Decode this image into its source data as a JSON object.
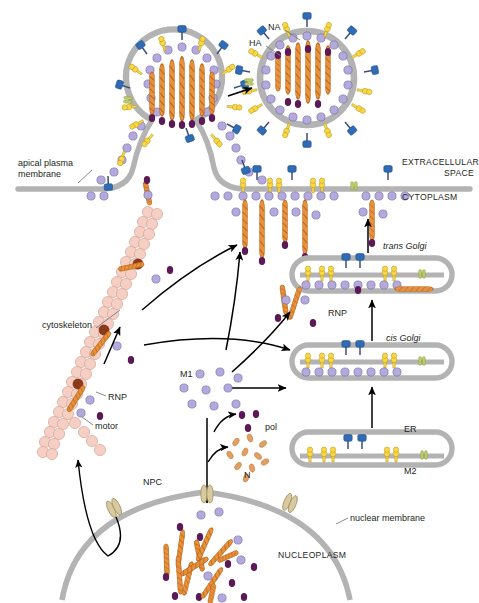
{
  "figure": {
    "domain": "biology-cell-diagram"
  },
  "labels": {
    "na": "NA",
    "ha": "HA",
    "apical_plasma_membrane_line1": "apical plasma",
    "apical_plasma_membrane_line2": "membrane",
    "extracellular_line1": "EXTRACELLULAR",
    "extracellular_line2": "SPACE",
    "cytoplasm": "CYTOPLASM",
    "trans_golgi": "trans Golgi",
    "cis_golgi": "cis Golgi",
    "er": "ER",
    "m2": "M2",
    "rnp_membrane": "RNP",
    "rnp_golgi": "RNP",
    "rnp_cytoskeleton": "RNP",
    "cytoskeleton": "cytoskeleton",
    "motor": "motor",
    "m1": "M1",
    "pol": "pol",
    "n": "N",
    "npc": "NPC",
    "nuclear_membrane": "nuclear membrane",
    "nucleoplasm": "NUCLEOPLASM"
  },
  "colors": {
    "ha_fill": "#f9d744",
    "ha_stroke": "#b89a23",
    "na_fill": "#2f6cb5",
    "na_stroke": "#1d4a82",
    "na_stalk": "#3a4f7a",
    "m2_fill": "#c2d06a",
    "m2_stroke": "#8d9a3c",
    "m1_fill": "#b3a9db",
    "m1_stroke": "#6f64a8",
    "rnp_fill": "#e8913c",
    "rnp_stroke": "#b8651a",
    "pol_fill": "#5b1a56",
    "membrane_gray": "#b3b3b3",
    "cytoskeleton_fill": "#f6cfc4",
    "cytoskeleton_stroke": "#d8a495",
    "motor_fill": "#8b3a1a",
    "npc_fill": "#d9c9a0",
    "npc_stroke": "#a08e5e",
    "n_fill": "#e0a064",
    "arrow": "#000000",
    "text": "#231f20"
  },
  "structures": {
    "budding_virion": {
      "name": "budding virion at apical plasma membrane",
      "ha_spikes": 14,
      "na_spikes": 9,
      "m2_channels": 1,
      "rnp_segments": 8
    },
    "released_virion": {
      "name": "released spherical influenza virion",
      "ha_spikes": 18,
      "na_spikes": 11,
      "m2_channels": 1,
      "rnp_segments": 8
    },
    "plasma_membrane": {
      "name": "apical plasma membrane with viral proteins",
      "ha_clusters": 4,
      "na_spikes": 4,
      "m2_channels": 1,
      "rnp_count": 5
    },
    "trans_golgi": {
      "ha_clusters": 3,
      "na_spikes": 2,
      "m2_channels": 1
    },
    "cis_golgi": {
      "ha_clusters": 3,
      "na_spikes": 2,
      "m2_channels": 1
    },
    "er": {
      "ha_clusters": 3,
      "na_spikes": 2,
      "m2_channels": 1
    },
    "cytoskeleton": {
      "filament_arms": 3,
      "motors": 3,
      "rnp_cargo": 4
    },
    "m1_pool": {
      "dot_count": 9
    },
    "pol_pool": {
      "dot_count": 3
    },
    "n_pool": {
      "dot_count": 10
    },
    "nucleus": {
      "rnp_segments": 14,
      "m1_dots": 6,
      "npc_count": 3
    }
  }
}
